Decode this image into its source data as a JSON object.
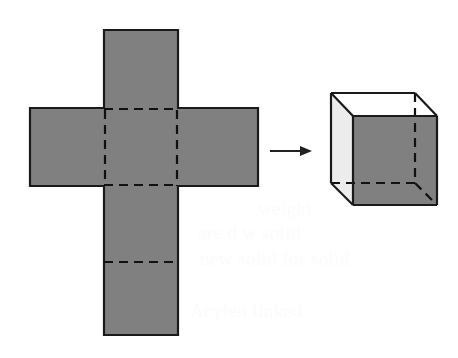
{
  "figure": {
    "background_color": "#ffffff"
  },
  "colors": {
    "shaded_face": "#808080",
    "light_face": "#ececec",
    "top_face": "#ffffff",
    "outline": "#1a1a1a",
    "dashed_fold": "#111111",
    "arrow": "#222222",
    "bleed_text": "#fbfbfb"
  },
  "net": {
    "label": "cube-net",
    "description": "Cross-shaped net of six squares",
    "fill": "#808080",
    "stroke": "#1a1a1a",
    "stroke_width": 2.2,
    "outline_points": "104,30 178,30 178,108 258,108 258,186 178,186 178,335 104,335 104,186 30,186 30,108 104,108",
    "fold_lines": [
      {
        "name": "fold-center-left",
        "x1": 105,
        "y1": 110,
        "x2": 105,
        "y2": 186
      },
      {
        "name": "fold-center-right",
        "x1": 177,
        "y1": 110,
        "x2": 177,
        "y2": 186
      },
      {
        "name": "fold-center-top",
        "x1": 104,
        "y1": 109,
        "x2": 178,
        "y2": 109
      },
      {
        "name": "fold-center-bottom",
        "x1": 104,
        "y1": 185,
        "x2": 178,
        "y2": 185
      },
      {
        "name": "fold-lower",
        "x1": 104,
        "y1": 262,
        "x2": 178,
        "y2": 262
      }
    ],
    "dash_pattern": "9,6"
  },
  "arrow": {
    "label": "transformation-arrow",
    "color": "#222222",
    "x1": 270,
    "y1": 151,
    "x2": 306,
    "y2": 151,
    "head_points": "312,151 300,146 300,156",
    "stroke_width": 1.8
  },
  "cube": {
    "label": "folded-cube",
    "stroke": "#1a1a1a",
    "stroke_width": 2.2,
    "dash_pattern": "9,6",
    "vertices": {
      "front_top_left": "353,116",
      "front_top_right": "437,116",
      "front_bottom_right": "437,205",
      "front_bottom_left": "353,205",
      "back_top_left": "331,93",
      "back_top_right": "415,93",
      "back_bottom_left": "331,183",
      "back_bottom_right": "415,183"
    },
    "faces": [
      {
        "name": "cube-face-front",
        "fill": "#808080",
        "points": "353,116 437,116 437,205 353,205"
      },
      {
        "name": "cube-face-top",
        "fill": "#ffffff",
        "points": "353,116 331,93 415,93 437,116"
      },
      {
        "name": "cube-face-left",
        "fill": "#ececec",
        "points": "353,116 331,93 331,183 353,205"
      }
    ],
    "solid_edges": [
      {
        "name": "edge-front-top",
        "x1": 353,
        "y1": 116,
        "x2": 437,
        "y2": 116
      },
      {
        "name": "edge-front-right",
        "x1": 437,
        "y1": 116,
        "x2": 437,
        "y2": 205
      },
      {
        "name": "edge-front-bottom",
        "x1": 353,
        "y1": 205,
        "x2": 437,
        "y2": 205
      },
      {
        "name": "edge-front-left",
        "x1": 353,
        "y1": 116,
        "x2": 353,
        "y2": 205
      },
      {
        "name": "edge-back-top",
        "x1": 331,
        "y1": 93,
        "x2": 415,
        "y2": 93
      },
      {
        "name": "edge-top-left-diagonal",
        "x1": 353,
        "y1": 116,
        "x2": 331,
        "y2": 93
      },
      {
        "name": "edge-top-right-diagonal",
        "x1": 437,
        "y1": 116,
        "x2": 415,
        "y2": 93
      },
      {
        "name": "edge-back-left-vertical",
        "x1": 331,
        "y1": 93,
        "x2": 331,
        "y2": 183
      },
      {
        "name": "edge-bottom-left-diagonal",
        "x1": 331,
        "y1": 183,
        "x2": 353,
        "y2": 205
      }
    ],
    "hidden_edges": [
      {
        "name": "hidden-edge-back-right-vertical",
        "x1": 415,
        "y1": 93,
        "x2": 415,
        "y2": 183
      },
      {
        "name": "hidden-edge-back-bottom",
        "x1": 331,
        "y1": 183,
        "x2": 415,
        "y2": 183
      },
      {
        "name": "hidden-edge-bottom-right-diagonal",
        "x1": 415,
        "y1": 183,
        "x2": 437,
        "y2": 205
      }
    ]
  },
  "bleed_text": [
    {
      "name": "bleed-line-1",
      "text": "weight",
      "x": 258,
      "y": 198
    },
    {
      "name": "bleed-line-2",
      "text": "are d  w solid",
      "x": 198,
      "y": 222
    },
    {
      "name": "bleed-line-3",
      "text": "new solid  for solid",
      "x": 200,
      "y": 248
    },
    {
      "name": "bleed-line-4",
      "text": "Acylen  linked",
      "x": 190,
      "y": 300
    }
  ]
}
